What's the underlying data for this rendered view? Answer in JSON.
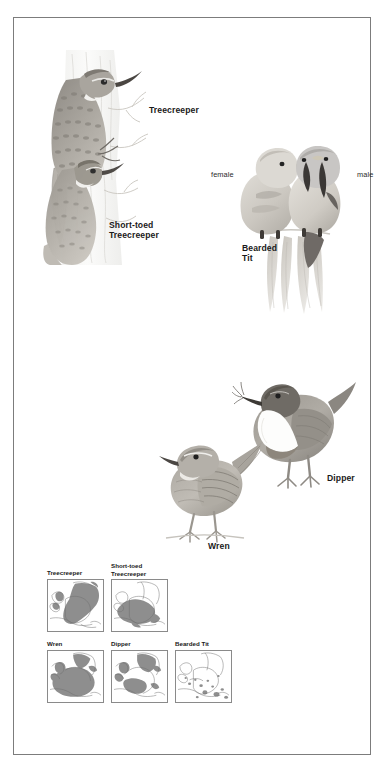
{
  "plate": {
    "frame_color": "#7c7c7c",
    "background": "#ffffff"
  },
  "illustrations": [
    {
      "id": "treecreeper-pair",
      "labels": [
        {
          "name": "treecreeper",
          "text": "Treecreeper"
        },
        {
          "name": "short-toed-treecreeper",
          "text": "Short-toed\nTreecreeper"
        }
      ]
    },
    {
      "id": "bearded-tit-pair",
      "labels": [
        {
          "name": "female",
          "text": "female"
        },
        {
          "name": "male",
          "text": "male"
        },
        {
          "name": "bearded-tit",
          "text": "Bearded\nTit"
        }
      ]
    },
    {
      "id": "wren",
      "labels": [
        {
          "name": "wren",
          "text": "Wren"
        }
      ]
    },
    {
      "id": "dipper",
      "labels": [
        {
          "name": "dipper",
          "text": "Dipper"
        }
      ]
    }
  ],
  "labels": {
    "treecreeper": "Treecreeper",
    "short_toed_treecreeper": "Short-toed\nTreecreeper",
    "female": "female",
    "male": "male",
    "bearded_tit": "Bearded\nTit",
    "wren": "Wren",
    "dipper": "Dipper"
  },
  "maps": {
    "caption": "European distribution maps",
    "row1": [
      {
        "name": "map-treecreeper",
        "label": "Treecreeper",
        "range_fill": "#8b8b8b",
        "coverage": "most of central and eastern Europe, Britain, Scandinavia"
      },
      {
        "name": "map-short-toed-treecreeper",
        "label": "Short-toed\nTreecreeper",
        "range_fill": "#8b8b8b",
        "coverage": "western and central Europe, Iberia, France, Italy"
      }
    ],
    "row2": [
      {
        "name": "map-wren",
        "label": "Wren",
        "range_fill": "#8b8b8b",
        "coverage": "nearly all of western and central Europe, Britain, Ireland"
      },
      {
        "name": "map-dipper",
        "label": "Dipper",
        "range_fill": "#8b8b8b",
        "coverage": "uplands of Britain, Scandinavia, central Europe"
      },
      {
        "name": "map-bearded-tit",
        "label": "Bearded Tit",
        "range_fill": "#8b8b8b",
        "coverage": "scattered wetland patches only"
      }
    ],
    "tile_border": "#8a8a8a",
    "land_outline": "#6e6e6e",
    "sea_fill": "#ffffff"
  }
}
